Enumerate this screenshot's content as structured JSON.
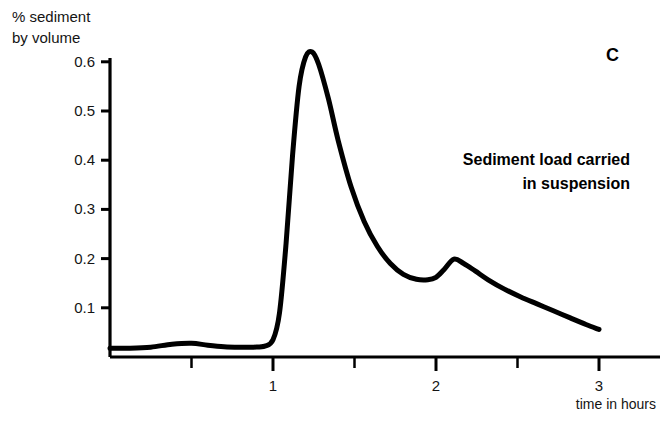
{
  "panel": {
    "label": "C"
  },
  "annotation": {
    "text": "Sediment load carried\nin suspension"
  },
  "axes": {
    "y_title": "% sediment\nby volume",
    "x_title": "time in hours"
  },
  "chart_data": {
    "type": "line",
    "title": "Sediment load carried in suspension",
    "xlabel": "time in hours",
    "ylabel": "% sediment by volume",
    "xlim": [
      0,
      3.3
    ],
    "ylim": [
      0,
      0.66
    ],
    "grid": false,
    "legend": null,
    "y_ticks": [
      0.1,
      0.2,
      0.3,
      0.4,
      0.5,
      0.6
    ],
    "y_tick_labels": [
      "0.1",
      "0.2",
      "0.3",
      "0.4",
      "0.5",
      "0.6"
    ],
    "x_ticks": [
      0.5,
      1,
      1.5,
      2,
      2.5,
      3
    ],
    "x_tick_labels": [
      "",
      "1",
      "",
      "2",
      "",
      "3"
    ],
    "x_major_ticks": [
      1,
      2,
      3
    ],
    "series": [
      {
        "name": "Sediment load carried in suspension",
        "color": "#000000",
        "x": [
          0.0,
          0.12,
          0.25,
          0.38,
          0.5,
          0.6,
          0.7,
          0.8,
          0.88,
          0.95,
          1.0,
          1.04,
          1.08,
          1.12,
          1.16,
          1.2,
          1.24,
          1.28,
          1.34,
          1.4,
          1.48,
          1.56,
          1.64,
          1.72,
          1.8,
          1.88,
          1.95,
          2.0,
          2.05,
          2.11,
          2.17,
          2.24,
          2.32,
          2.42,
          2.52,
          2.62,
          2.72,
          2.82,
          2.92,
          3.0
        ],
        "y": [
          0.018,
          0.018,
          0.02,
          0.026,
          0.028,
          0.024,
          0.021,
          0.02,
          0.02,
          0.022,
          0.035,
          0.09,
          0.23,
          0.41,
          0.55,
          0.61,
          0.62,
          0.595,
          0.525,
          0.44,
          0.345,
          0.275,
          0.225,
          0.19,
          0.168,
          0.158,
          0.157,
          0.162,
          0.178,
          0.199,
          0.19,
          0.175,
          0.157,
          0.138,
          0.122,
          0.108,
          0.094,
          0.08,
          0.066,
          0.056
        ]
      }
    ],
    "features": {
      "main_peak": {
        "x": 1.2,
        "y": 0.62
      },
      "secondary_peak": {
        "x": 2.11,
        "y": 0.2
      },
      "trough": {
        "x": 1.93,
        "y": 0.157
      },
      "baseline": 0.02,
      "end_value": {
        "x": 3.0,
        "y": 0.056
      }
    }
  }
}
